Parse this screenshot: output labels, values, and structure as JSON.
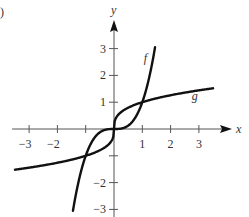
{
  "part_marker": ")",
  "chart_data": {
    "type": "line",
    "title": "",
    "xlabel": "x",
    "ylabel": "y",
    "xlim": [
      -3.6,
      4
    ],
    "ylim": [
      -3.3,
      4
    ],
    "grid": false,
    "x_ticks": [
      -3,
      -2,
      -1,
      1,
      2,
      3
    ],
    "x_tick_labels": [
      "−3",
      "−2",
      "",
      "1",
      "2",
      "3"
    ],
    "y_ticks": [
      -3,
      -2,
      -1,
      1,
      2,
      3
    ],
    "y_tick_labels": [
      "−3",
      "−2",
      "",
      "1",
      "2",
      "3"
    ],
    "series": [
      {
        "name": "f",
        "expression": "x^3",
        "x": [
          -1.45,
          -1.2,
          -1,
          -0.7,
          -0.4,
          0,
          0.4,
          0.7,
          1,
          1.2,
          1.45
        ],
        "y": [
          -3.05,
          -1.73,
          -1,
          -0.34,
          -0.06,
          0,
          0.06,
          0.34,
          1,
          1.73,
          3.05
        ]
      },
      {
        "name": "g",
        "expression": "x^(1/3)",
        "x": [
          -3.5,
          -3,
          -2,
          -1,
          -0.5,
          -0.1,
          0,
          0.1,
          0.5,
          1,
          2,
          3,
          3.5
        ],
        "y": [
          -1.52,
          -1.44,
          -1.26,
          -1,
          -0.79,
          -0.46,
          0,
          0.46,
          0.79,
          1,
          1.26,
          1.44,
          1.52
        ]
      }
    ],
    "annotations": [
      {
        "text": "f",
        "x": 1.05,
        "y": 2.5
      },
      {
        "text": "g",
        "x": 2.75,
        "y": 1.1
      }
    ]
  }
}
